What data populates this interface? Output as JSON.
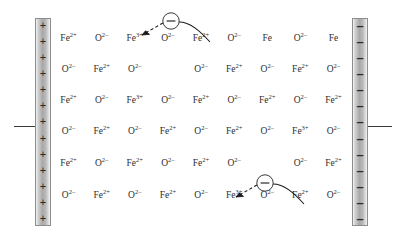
{
  "figure": {
    "title": ""
  },
  "electrodes": {
    "positive": {
      "name": "positive-electrode",
      "sign": "+",
      "sign_count": 13,
      "lead_label": ""
    },
    "negative": {
      "name": "negative-electrode",
      "sign": "–",
      "sign_count": 13,
      "lead_label": ""
    }
  },
  "electrons": [
    {
      "label": "–",
      "target": "Fe3+",
      "row": 1,
      "column": 3
    },
    {
      "label": "–",
      "target": "Fe3+",
      "row": 6,
      "column": 6
    }
  ],
  "colors": {
    "ion_text": "#2e2e2e",
    "electrode_fill": "#a8a8a8",
    "electrode_border": "#8d8d8d",
    "wire": "#3a3a3a",
    "arrow": "#1a1a1a"
  },
  "lattice": {
    "rows": [
      [
        {
          "species": "Fe",
          "charge": "2+"
        },
        {
          "species": "O",
          "charge": "2–"
        },
        {
          "species": "Fe",
          "charge": "3+"
        },
        {
          "species": "O",
          "charge": "2–"
        },
        {
          "species": "Fe",
          "charge": "2+"
        },
        {
          "species": "O",
          "charge": "2–"
        },
        {
          "species": "Fe",
          "charge": ""
        },
        {
          "species": "O",
          "charge": "2–"
        },
        {
          "species": "Fe",
          "charge": ""
        }
      ],
      [
        {
          "species": "O",
          "charge": "2–"
        },
        {
          "species": "Fe",
          "charge": "2+"
        },
        {
          "species": "O",
          "charge": "2–"
        },
        {
          "species": "",
          "charge": ""
        },
        {
          "species": "O",
          "charge": "2–"
        },
        {
          "species": "Fe",
          "charge": "2+"
        },
        {
          "species": "O",
          "charge": "2–"
        },
        {
          "species": "Fe",
          "charge": "2+"
        },
        {
          "species": "O",
          "charge": "2–"
        }
      ],
      [
        {
          "species": "Fe",
          "charge": "2+"
        },
        {
          "species": "O",
          "charge": "2–"
        },
        {
          "species": "Fe",
          "charge": "3+"
        },
        {
          "species": "O",
          "charge": "2–"
        },
        {
          "species": "Fe",
          "charge": "2+"
        },
        {
          "species": "O",
          "charge": "2–"
        },
        {
          "species": "Fe",
          "charge": "2+"
        },
        {
          "species": "O",
          "charge": "2–"
        },
        {
          "species": "Fe",
          "charge": "2+"
        }
      ],
      [
        {
          "species": "O",
          "charge": "2–"
        },
        {
          "species": "Fe",
          "charge": "2+"
        },
        {
          "species": "O",
          "charge": "2–"
        },
        {
          "species": "Fe",
          "charge": "2+"
        },
        {
          "species": "O",
          "charge": "2–"
        },
        {
          "species": "Fe",
          "charge": "2+"
        },
        {
          "species": "O",
          "charge": "2–"
        },
        {
          "species": "Fe",
          "charge": "3+"
        },
        {
          "species": "O",
          "charge": "2–"
        }
      ],
      [
        {
          "species": "Fe",
          "charge": "2+"
        },
        {
          "species": "O",
          "charge": "2–"
        },
        {
          "species": "Fe",
          "charge": "2+"
        },
        {
          "species": "O",
          "charge": "2–"
        },
        {
          "species": "Fe",
          "charge": "2+"
        },
        {
          "species": "O",
          "charge": "2–"
        },
        {
          "species": "",
          "charge": ""
        },
        {
          "species": "O",
          "charge": "2–"
        },
        {
          "species": "Fe",
          "charge": "2+"
        }
      ],
      [
        {
          "species": "O",
          "charge": "2–"
        },
        {
          "species": "Fe",
          "charge": "2+"
        },
        {
          "species": "O",
          "charge": "2–"
        },
        {
          "species": "Fe",
          "charge": "2+"
        },
        {
          "species": "O",
          "charge": "2–"
        },
        {
          "species": "Fe",
          "charge": "3+"
        },
        {
          "species": "O",
          "charge": "2–"
        },
        {
          "species": "Fe",
          "charge": "2+"
        },
        {
          "species": "O",
          "charge": "2–"
        }
      ]
    ]
  }
}
